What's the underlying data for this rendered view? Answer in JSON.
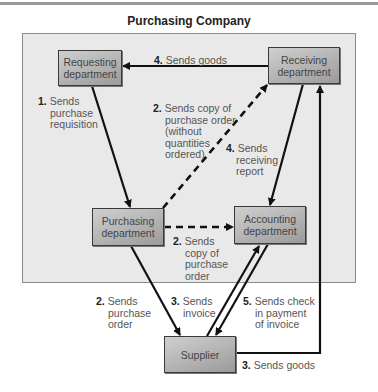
{
  "title": "Purchasing Company",
  "departments": {
    "requesting": {
      "line1": "Requesting",
      "line2": "department"
    },
    "receiving": {
      "line1": "Receiving",
      "line2": "department"
    },
    "purchasing": {
      "line1": "Purchasing",
      "line2": "department"
    },
    "accounting": {
      "line1": "Accounting",
      "line2": "department"
    },
    "supplier": {
      "line1": "Supplier"
    }
  },
  "flows": [
    {
      "step": "1.",
      "lines": [
        "Sends",
        "purchase",
        "requisition"
      ],
      "from": "Requesting department",
      "to": "Purchasing department",
      "style": "solid"
    },
    {
      "step": "2.",
      "lines": [
        "Sends copy of",
        "purchase order",
        "(without",
        "quantities",
        "ordered)"
      ],
      "from": "Purchasing department",
      "to": "Receiving department",
      "style": "dashed"
    },
    {
      "step": "2.",
      "lines": [
        "Sends",
        "copy of",
        "purchase",
        "order"
      ],
      "from": "Purchasing department",
      "to": "Accounting department",
      "style": "dashed"
    },
    {
      "step": "2.",
      "lines": [
        "Sends",
        "purchase",
        "order"
      ],
      "from": "Purchasing department",
      "to": "Supplier",
      "style": "solid"
    },
    {
      "step": "3.",
      "lines": [
        "Sends",
        "invoice"
      ],
      "from": "Supplier",
      "to": "Accounting department",
      "style": "solid"
    },
    {
      "step": "3.",
      "lines": [
        "Sends goods"
      ],
      "from": "Supplier",
      "to": "Receiving department",
      "style": "solid"
    },
    {
      "step": "4.",
      "lines": [
        "Sends goods"
      ],
      "from": "Receiving department",
      "to": "Requesting department",
      "style": "solid"
    },
    {
      "step": "4.",
      "lines": [
        "Sends",
        "receiving",
        "report"
      ],
      "from": "Receiving department",
      "to": "Accounting department",
      "style": "solid"
    },
    {
      "step": "5.",
      "lines": [
        "Sends check",
        "in payment",
        "of invoice"
      ],
      "from": "Accounting department",
      "to": "Supplier",
      "style": "solid"
    }
  ],
  "colors": {
    "company_bg": "#e9e9e9",
    "box_fill": "#b3b3b3",
    "line": "#111111",
    "label": "#555555"
  }
}
